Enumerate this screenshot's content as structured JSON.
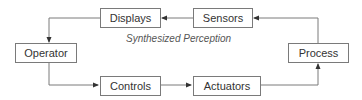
{
  "diagram": {
    "nodes": {
      "displays": "Displays",
      "sensors": "Sensors",
      "operator": "Operator",
      "process": "Process",
      "controls": "Controls",
      "actuators": "Actuators"
    },
    "caption": "Synthesized Perception",
    "edges": [
      {
        "from": "Sensors",
        "to": "Displays"
      },
      {
        "from": "Displays",
        "to": "Operator"
      },
      {
        "from": "Operator",
        "to": "Controls"
      },
      {
        "from": "Controls",
        "to": "Actuators"
      },
      {
        "from": "Actuators",
        "to": "Process"
      },
      {
        "from": "Process",
        "to": "Sensors"
      }
    ],
    "line_color": "#7a7a7a"
  }
}
